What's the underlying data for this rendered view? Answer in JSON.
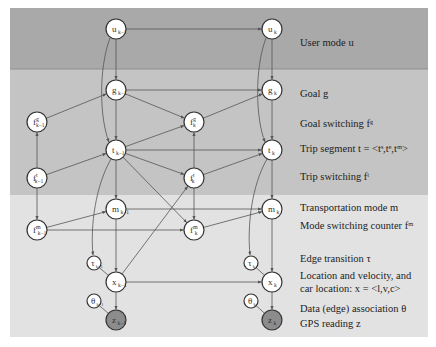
{
  "colors": {
    "band_user": "#a9a9a9",
    "band_trip": "#c4c4c4",
    "band_physical": "#e2e2e2",
    "node_fill": "#ffffff",
    "observed_fill": "#8c8c8c",
    "edge": "#555555"
  },
  "bands": [
    {
      "name": "user-mode-band",
      "y": 8,
      "h": 61
    },
    {
      "name": "trip-band",
      "y": 69,
      "h": 126
    },
    {
      "name": "physical-band",
      "y": 195,
      "h": 142
    }
  ],
  "legend": [
    {
      "key": "user_mode",
      "text": "User mode u",
      "y": 46
    },
    {
      "key": "goal",
      "text": "Goal g",
      "y": 97
    },
    {
      "key": "goal_switching",
      "text": "Goal switching  fᵍ",
      "y": 127
    },
    {
      "key": "trip_segment",
      "text": "Trip segment t = <tˢ,tᵉ,tᵐ>",
      "y": 152
    },
    {
      "key": "trip_switching",
      "text": "Trip switching  fᵗ",
      "y": 180
    },
    {
      "key": "transport_mode",
      "text": "Transportation mode m",
      "y": 211
    },
    {
      "key": "mode_switching",
      "text": "Mode switching counter  fᵐ",
      "y": 229
    },
    {
      "key": "edge_transition",
      "text": "Edge transition  τ",
      "y": 262
    },
    {
      "key": "location_1",
      "text": "Location and velocity, and",
      "y": 279
    },
    {
      "key": "location_2",
      "text": "car location:  x = <l,v,c>",
      "y": 292
    },
    {
      "key": "data_assoc",
      "text": "Data (edge) association  θ",
      "y": 312
    },
    {
      "key": "gps",
      "text": "GPS reading z",
      "y": 327
    }
  ],
  "nodes": [
    {
      "id": "u_km1",
      "main": "u",
      "sup": "",
      "sub": "k−1",
      "x": 116,
      "y": 29,
      "r": 10,
      "observed": false
    },
    {
      "id": "u_k",
      "main": "u",
      "sup": "",
      "sub": "k",
      "x": 272,
      "y": 29,
      "r": 10,
      "observed": false
    },
    {
      "id": "g_km1",
      "main": "g",
      "sup": "",
      "sub": "k−1",
      "x": 116,
      "y": 90,
      "r": 10,
      "observed": false
    },
    {
      "id": "g_k",
      "main": "g",
      "sup": "",
      "sub": "k",
      "x": 272,
      "y": 90,
      "r": 10,
      "observed": false
    },
    {
      "id": "fg_km1",
      "main": "f",
      "sup": "g",
      "sub": "k−1",
      "x": 37,
      "y": 122,
      "r": 10,
      "observed": false
    },
    {
      "id": "fg_k",
      "main": "f",
      "sup": "g",
      "sub": "k",
      "x": 194,
      "y": 122,
      "r": 10,
      "observed": false
    },
    {
      "id": "t_km1",
      "main": "t",
      "sup": "",
      "sub": "k−1",
      "x": 116,
      "y": 150,
      "r": 10,
      "observed": false
    },
    {
      "id": "t_k",
      "main": "t",
      "sup": "",
      "sub": "k",
      "x": 272,
      "y": 150,
      "r": 10,
      "observed": false
    },
    {
      "id": "ft_km1",
      "main": "f",
      "sup": "t",
      "sub": "k−1",
      "x": 37,
      "y": 178,
      "r": 10,
      "observed": false
    },
    {
      "id": "ft_k",
      "main": "f",
      "sup": "t",
      "sub": "k",
      "x": 194,
      "y": 178,
      "r": 10,
      "observed": false
    },
    {
      "id": "m_km1",
      "main": "m",
      "sup": "",
      "sub": "k−1",
      "x": 116,
      "y": 209,
      "r": 10,
      "observed": false
    },
    {
      "id": "m_k",
      "main": "m",
      "sup": "",
      "sub": "k",
      "x": 272,
      "y": 209,
      "r": 10,
      "observed": false
    },
    {
      "id": "fm_km1",
      "main": "f",
      "sup": "m",
      "sub": "k−1",
      "x": 37,
      "y": 230,
      "r": 10,
      "observed": false
    },
    {
      "id": "fm_k",
      "main": "f",
      "sup": "m",
      "sub": "k",
      "x": 194,
      "y": 230,
      "r": 10,
      "observed": false
    },
    {
      "id": "tau_km1",
      "main": "τ",
      "sup": "",
      "sub": "k−1",
      "x": 94,
      "y": 263,
      "r": 7,
      "observed": false
    },
    {
      "id": "tau_k",
      "main": "τ",
      "sup": "",
      "sub": "k",
      "x": 251,
      "y": 263,
      "r": 7,
      "observed": false
    },
    {
      "id": "x_km1",
      "main": "x",
      "sup": "",
      "sub": "k−1",
      "x": 116,
      "y": 282,
      "r": 10,
      "observed": false
    },
    {
      "id": "x_k",
      "main": "x",
      "sup": "",
      "sub": "k",
      "x": 272,
      "y": 282,
      "r": 10,
      "observed": false
    },
    {
      "id": "th_km1",
      "main": "θ",
      "sup": "",
      "sub": "k−1",
      "x": 94,
      "y": 301,
      "r": 7,
      "observed": false
    },
    {
      "id": "th_k",
      "main": "θ",
      "sup": "",
      "sub": "k",
      "x": 251,
      "y": 301,
      "r": 7,
      "observed": false
    },
    {
      "id": "z_km1",
      "main": "z",
      "sup": "",
      "sub": "k−1",
      "x": 116,
      "y": 320,
      "r": 10,
      "observed": true
    },
    {
      "id": "z_k",
      "main": "z",
      "sup": "",
      "sub": "k",
      "x": 272,
      "y": 320,
      "r": 10,
      "observed": true
    }
  ],
  "edges": [
    [
      "u_km1",
      "u_k"
    ],
    [
      "u_km1",
      "g_km1"
    ],
    [
      "u_k",
      "g_k"
    ],
    [
      "g_km1",
      "g_k"
    ],
    [
      "g_km1",
      "t_km1"
    ],
    [
      "g_km1",
      "fg_k"
    ],
    [
      "g_k",
      "t_k"
    ],
    [
      "fg_km1",
      "g_km1"
    ],
    [
      "fg_k",
      "g_k"
    ],
    [
      "t_km1",
      "t_k"
    ],
    [
      "t_km1",
      "fg_k"
    ],
    [
      "t_km1",
      "ft_k"
    ],
    [
      "t_km1",
      "m_km1"
    ],
    [
      "t_km1",
      "fm_k"
    ],
    [
      "ft_km1",
      "fg_km1"
    ],
    [
      "ft_km1",
      "t_km1"
    ],
    [
      "ft_km1",
      "fm_km1"
    ],
    [
      "ft_k",
      "fg_k"
    ],
    [
      "ft_k",
      "t_k"
    ],
    [
      "ft_k",
      "fm_k"
    ],
    [
      "t_k",
      "m_k"
    ],
    [
      "m_km1",
      "m_k"
    ],
    [
      "m_km1",
      "x_km1"
    ],
    [
      "m_k",
      "x_k"
    ],
    [
      "fm_km1",
      "m_km1"
    ],
    [
      "fm_km1",
      "fm_k"
    ],
    [
      "fm_k",
      "m_k"
    ],
    [
      "x_km1",
      "x_k"
    ],
    [
      "x_km1",
      "ft_k"
    ],
    [
      "x_km1",
      "z_km1"
    ],
    [
      "x_k",
      "z_k"
    ],
    [
      "tau_km1",
      "x_km1"
    ],
    [
      "tau_k",
      "x_k"
    ],
    [
      "th_km1",
      "z_km1"
    ],
    [
      "th_k",
      "z_k"
    ]
  ],
  "curved_edges": [
    {
      "from": "u_km1",
      "to": "t_km1",
      "path": "M110,38 C98,70 100,120 109,142"
    },
    {
      "from": "u_k",
      "to": "t_k",
      "path": "M266,38 C254,70 256,120 265,142"
    },
    {
      "from": "t_km1",
      "to": "tau_km1",
      "path": "M111,159 C96,185 90,225 93,255"
    },
    {
      "from": "t_k",
      "to": "tau_k",
      "path": "M267,159 C252,185 247,225 250,255"
    }
  ]
}
